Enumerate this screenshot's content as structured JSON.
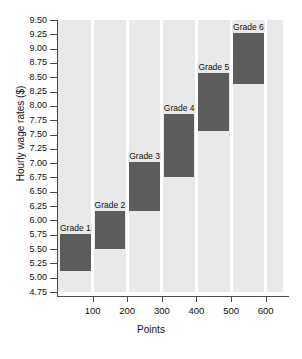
{
  "chart_data": {
    "type": "bar",
    "title": "",
    "xlabel": "Points",
    "ylabel": "Hourly wage rates ($)",
    "xlim": [
      0,
      650
    ],
    "ylim": [
      4.75,
      9.5
    ],
    "grid": true,
    "legend": "none",
    "orientation": "stepped-range-bars",
    "xticks": [
      100,
      200,
      300,
      400,
      500,
      600
    ],
    "yticks": [
      4.75,
      5.0,
      5.25,
      5.5,
      5.75,
      6.0,
      6.25,
      6.5,
      6.75,
      7.0,
      7.25,
      7.5,
      7.75,
      8.0,
      8.25,
      8.5,
      8.75,
      9.0,
      9.25,
      9.5
    ],
    "categories": [
      "Grade 1",
      "Grade 2",
      "Grade 3",
      "Grade 4",
      "Grade 5",
      "Grade 6"
    ],
    "bars": [
      {
        "label": "Grade 1",
        "x_start": 0,
        "x_end": 100,
        "y_low": 5.11,
        "y_high": 5.77
      },
      {
        "label": "Grade 2",
        "x_start": 100,
        "x_end": 200,
        "y_low": 5.5,
        "y_high": 6.17
      },
      {
        "label": "Grade 3",
        "x_start": 200,
        "x_end": 300,
        "y_low": 6.17,
        "y_high": 7.02
      },
      {
        "label": "Grade 4",
        "x_start": 300,
        "x_end": 400,
        "y_low": 6.76,
        "y_high": 7.86
      },
      {
        "label": "Grade 5",
        "x_start": 400,
        "x_end": 500,
        "y_low": 7.57,
        "y_high": 8.58
      },
      {
        "label": "Grade 6",
        "x_start": 500,
        "x_end": 600,
        "y_low": 8.38,
        "y_high": 9.27
      }
    ],
    "colors": {
      "bar": "#5c5c5c",
      "plot_background": "#e9e9e9",
      "gridline": "#ffffff",
      "axis": "#4a4a4a",
      "page_background": "#ffffff"
    }
  }
}
